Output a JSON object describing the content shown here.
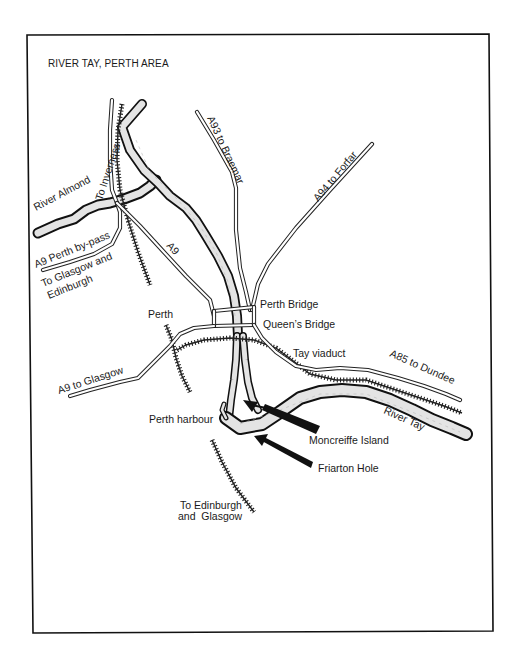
{
  "map": {
    "title": "RIVER TAY, PERTH AREA",
    "colors": {
      "ink": "#1a1a1a",
      "background": "#ffffff",
      "river_fill": "#e4e4e4"
    },
    "labels": {
      "to_inverness": "To Inverness",
      "river_almond": "River Almond",
      "a9_bypass": "A9 Perth by-pass",
      "to_glasgow_edinburgh_1": "To Glasgow and",
      "to_glasgow_edinburgh_2": "Edinburgh",
      "a9": "A9",
      "a93": "A93 to Braemar",
      "a94": "A94 to Forfar",
      "perth": "Perth",
      "perth_bridge": "Perth Bridge",
      "queens_bridge": "Queen’s Bridge",
      "tay_viaduct": "Tay viaduct",
      "a85": "A85 to Dundee",
      "a9_glasgow": "A9 to Glasgow",
      "river_tay": "River Tay",
      "perth_harbour": "Perth harbour",
      "moncreiffe_island": "Moncreiffe Island",
      "friarton_hole": "Friarton Hole",
      "to_edinburgh_glasgow_1": "To Edinburgh",
      "to_edinburgh_glasgow_2": "and  Glasgow"
    }
  }
}
